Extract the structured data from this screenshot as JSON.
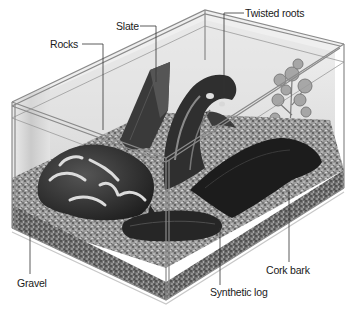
{
  "diagram": {
    "labels": {
      "slate": "Slate",
      "rocks": "Rocks",
      "twisted_roots": "Twisted roots",
      "gravel": "Gravel",
      "synthetic_log": "Synthetic log",
      "cork_bark": "Cork bark"
    },
    "colors": {
      "background": "#ffffff",
      "glass_edge": "#8a8a8a",
      "gravel": "#8c8c8c",
      "dark_objects": "#2a2a2a",
      "label_text": "#1a1a1a",
      "leader_line": "#333333"
    }
  }
}
